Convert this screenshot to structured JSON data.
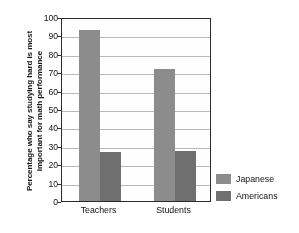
{
  "chart_data": {
    "type": "bar",
    "title": "",
    "subtitle": "",
    "xlabel": "",
    "ylabel": "Percentage who say studying hard is most\nimportant for math performance",
    "categories": [
      "Teachers",
      "Students"
    ],
    "series": [
      {
        "name": "Japanese",
        "color": "#8c8c8c",
        "values": [
          93,
          72
        ]
      },
      {
        "name": "Americans",
        "color": "#6f6f6f",
        "values": [
          26.5,
          27
        ]
      }
    ],
    "ylim": [
      0,
      100
    ],
    "ytick_step": 10,
    "yticks": [
      0,
      10,
      20,
      30,
      40,
      50,
      60,
      70,
      80,
      90,
      100
    ],
    "ytick_labels": [
      "0",
      "10",
      "20",
      "30",
      "40",
      "50",
      "60",
      "70",
      "80",
      "90",
      "100"
    ],
    "grid": true,
    "grid_axis": "y",
    "legend_position": "right",
    "legend_entries": [
      "Japanese",
      "Americans"
    ],
    "plot_border": true,
    "annotations": []
  }
}
